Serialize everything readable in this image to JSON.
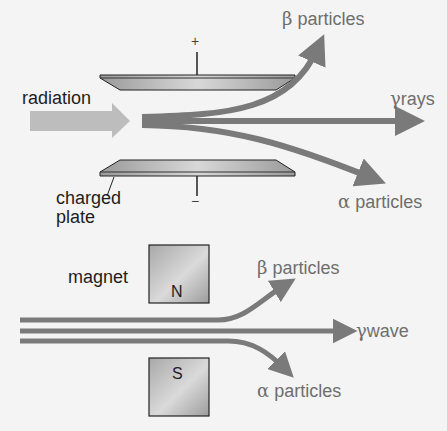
{
  "electric_field": {
    "source_label": "radiation",
    "plate_label_line1": "charged",
    "plate_label_line2": "plate",
    "top_plate_sign": "+",
    "bottom_plate_sign": "−",
    "outputs": {
      "beta": {
        "symbol": "β",
        "text": "particles"
      },
      "gamma": {
        "symbol": "γ",
        "text": "rays"
      },
      "alpha": {
        "symbol": "α",
        "text": "particles"
      }
    }
  },
  "magnetic_field": {
    "magnet_label": "magnet",
    "north_pole": "N",
    "south_pole": "S",
    "outputs": {
      "beta": {
        "symbol": "β",
        "text": "particles"
      },
      "gamma": {
        "symbol": "γ",
        "text": "wave"
      },
      "alpha": {
        "symbol": "α",
        "text": "particles"
      }
    }
  },
  "colors": {
    "beam": "#7a7a7a",
    "source_arrow": "#bdbdbd",
    "label_dark": "#1e1e1e",
    "label_grey": "#6e6e6e",
    "background": "#f4f4f4"
  }
}
